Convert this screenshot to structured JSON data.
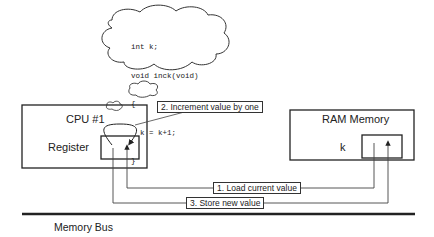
{
  "diagram": {
    "thought_bubble": {
      "code_lines": [
        "int k;",
        "void inck(void)",
        "{",
        "  k = k+1;",
        "}"
      ]
    },
    "cpu": {
      "title": "CPU #1",
      "register_label": "Register"
    },
    "ram": {
      "title": "RAM Memory",
      "variable_label": "k"
    },
    "steps": [
      {
        "label": "1. Load current value"
      },
      {
        "label": "2. Increment value by one"
      },
      {
        "label": "3. Store new value"
      }
    ],
    "bus": {
      "label": "Memory Bus"
    }
  }
}
